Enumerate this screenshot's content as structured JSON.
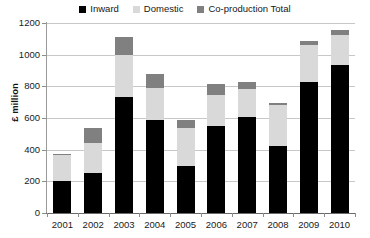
{
  "chart_data": {
    "type": "bar",
    "stacked": true,
    "title": "",
    "xlabel": "",
    "ylabel": "£ million",
    "categories": [
      "2001",
      "2002",
      "2003",
      "2004",
      "2005",
      "2006",
      "2007",
      "2008",
      "2009",
      "2010"
    ],
    "series": [
      {
        "name": "Inward",
        "color": "#000000",
        "values": [
          200,
          255,
          730,
          590,
          295,
          550,
          605,
          425,
          825,
          935
        ]
      },
      {
        "name": "Domestic",
        "color": "#d9d9d9",
        "values": [
          165,
          190,
          265,
          200,
          245,
          195,
          180,
          260,
          235,
          190
        ]
      },
      {
        "name": "Co-production Total",
        "color": "#808080",
        "values": [
          5,
          95,
          115,
          85,
          45,
          70,
          45,
          10,
          25,
          30
        ]
      }
    ],
    "totals": [
      370,
      540,
      1110,
      875,
      585,
      815,
      830,
      695,
      1085,
      1155
    ],
    "ylim": [
      0,
      1200
    ],
    "yticks": [
      0,
      200,
      400,
      600,
      800,
      1000,
      1200
    ],
    "ytick_labels": [
      "0",
      "200",
      "400",
      "600",
      "800",
      "1000",
      "1200"
    ],
    "grid": true,
    "legend_position": "top-center"
  },
  "legend": {
    "items": [
      {
        "label": "Inward",
        "color": "#000000"
      },
      {
        "label": "Domestic",
        "color": "#d9d9d9"
      },
      {
        "label": "Co-production Total",
        "color": "#808080"
      }
    ]
  },
  "axes": {
    "y_title": "£ million"
  }
}
